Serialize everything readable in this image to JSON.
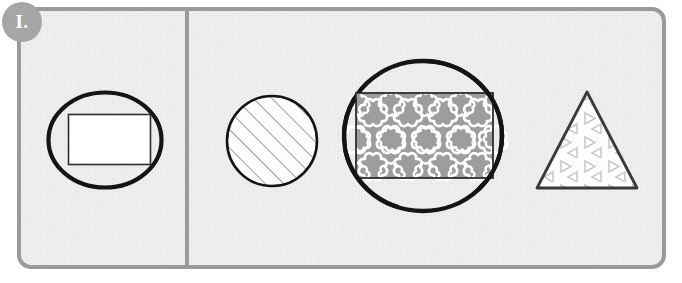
{
  "worksheet": {
    "badge_label": "I.",
    "background_color": "#e9e9e9",
    "border_color": "#9a9a9a",
    "divider_color": "#9a9a9a",
    "badge_color": "#a6a6a6",
    "outline_color": "#1a1a1a"
  },
  "sections": [
    {
      "name": "left-section",
      "shapes": [
        {
          "name": "oval-with-rectangle",
          "outer_shape": "ellipse",
          "inner_shape": "rectangle",
          "inner_fill": "white",
          "inner_pattern": "none",
          "outline_color": "#1a1a1a"
        }
      ]
    },
    {
      "name": "right-section",
      "shapes": [
        {
          "name": "circle-diagonal-hatch",
          "outer_shape": "circle",
          "inner_shape": "none",
          "inner_fill": "white",
          "inner_pattern": "diagonal-lines",
          "pattern_color": "#8c8c8c",
          "outline_color": "#1a1a1a"
        },
        {
          "name": "oval-with-flower-rectangle",
          "outer_shape": "ellipse",
          "inner_shape": "rectangle",
          "inner_fill": "#9a9a9a",
          "inner_pattern": "flowers",
          "pattern_color": "#ffffff",
          "outline_color": "#1a1a1a"
        },
        {
          "name": "triangle-with-triangles",
          "outer_shape": "triangle",
          "inner_shape": "none",
          "inner_fill": "white",
          "inner_pattern": "small-triangles",
          "pattern_color": "#c9c9c9",
          "outline_color": "#3a3a3a"
        }
      ]
    }
  ]
}
